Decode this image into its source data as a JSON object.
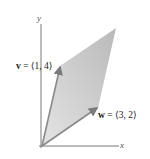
{
  "diagram": {
    "type": "vector-parallelogram",
    "axes": {
      "x_label": "x",
      "y_label": "y"
    },
    "vectors": [
      {
        "name": "v",
        "components": "⟨1, 4⟩",
        "equals": " = ",
        "label_full": "v = ⟨1, 4⟩"
      },
      {
        "name": "w",
        "components": "⟨3, 2⟩",
        "equals": " = ",
        "label_full": "w = ⟨3, 2⟩"
      }
    ],
    "colors": {
      "fill": "#c8c8c8",
      "vector_edge": "#8a8a8a",
      "axis": "#6a6a6a",
      "text": "#222222"
    }
  }
}
